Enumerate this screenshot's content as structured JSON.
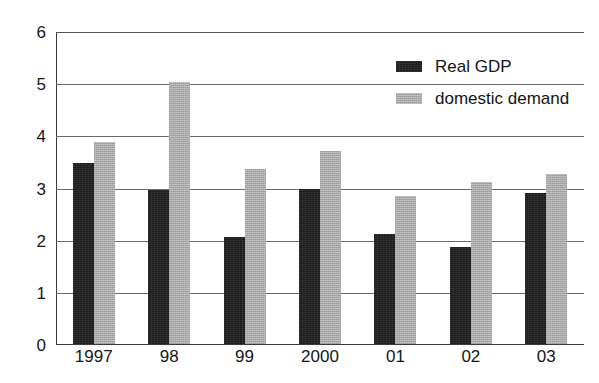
{
  "chart_data": {
    "type": "bar",
    "title": "",
    "xlabel": "",
    "ylabel": "",
    "categories": [
      "1997",
      "98",
      "99",
      "2000",
      "01",
      "02",
      "03"
    ],
    "series": [
      {
        "name": "Real GDP",
        "color": "#1e1e1e",
        "values": [
          3.48,
          2.98,
          2.07,
          3.0,
          2.13,
          1.87,
          2.92
        ]
      },
      {
        "name": "domestic demand",
        "color": "#a9a9a9",
        "values": [
          3.9,
          5.05,
          3.38,
          3.72,
          2.85,
          3.12,
          3.28
        ]
      }
    ],
    "ylim": [
      0,
      6
    ],
    "yticks": [
      0,
      1,
      2,
      3,
      4,
      5,
      6
    ],
    "ytick_labels": [
      "0",
      "1",
      "2",
      "3",
      "4",
      "5",
      "6"
    ],
    "grid": true,
    "grid_axis": "y",
    "legend_position": "upper-right"
  },
  "legend": {
    "entries": [
      {
        "label": "Real GDP",
        "swatch": "dark-swatch"
      },
      {
        "label": "domestic demand",
        "swatch": "light-swatch"
      }
    ]
  },
  "title_fragment": ""
}
